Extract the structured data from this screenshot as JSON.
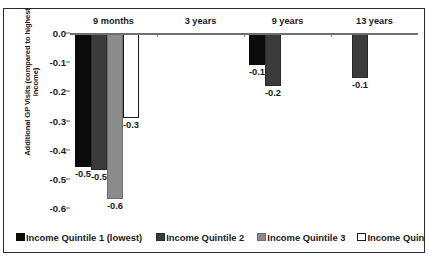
{
  "chart_data": {
    "type": "bar",
    "title": "",
    "subtitle": "",
    "xlabel": "",
    "ylabel": "Additional GP Visits (compared to highest income)",
    "ylabel_lines": [
      "Additional GP Visits (compared to highest",
      "income)"
    ],
    "categories": [
      "9 months",
      "3 years",
      "9 years",
      "13 years"
    ],
    "ylim": [
      -0.6,
      0.0
    ],
    "ytick_labels": [
      "0.0",
      "-0.1",
      "-0.2",
      "-0.3",
      "-0.4",
      "-0.5",
      "-0.6"
    ],
    "ytick_values": [
      0.0,
      -0.1,
      -0.2,
      -0.3,
      -0.4,
      -0.5,
      -0.6
    ],
    "grid": false,
    "legend_position": "bottom",
    "orientation": "vertical",
    "series": [
      {
        "name": "Income Quintile 1 (lowest)",
        "key": "q1",
        "color": "#0b0b0b",
        "values": [
          -0.46,
          null,
          -0.11,
          null
        ],
        "labels": [
          "-0.5",
          "",
          "-0.1",
          ""
        ]
      },
      {
        "name": "Income Quintile 2",
        "key": "q2",
        "color": "#3b3b3b",
        "values": [
          -0.47,
          null,
          -0.18,
          -0.155
        ],
        "labels": [
          "-0.5",
          "",
          "-0.2",
          "-0.1"
        ]
      },
      {
        "name": "Income Quintile 3",
        "key": "q3",
        "color": "#8b8b8b",
        "values": [
          -0.57,
          null,
          null,
          null
        ],
        "labels": [
          "-0.6",
          "",
          "",
          ""
        ]
      },
      {
        "name": "Income Quintile 4",
        "key": "q4",
        "color": "#ffffff",
        "values": [
          -0.29,
          null,
          null,
          null
        ],
        "labels": [
          "-0.3",
          "",
          "",
          ""
        ]
      }
    ],
    "data_point_labels": [
      {
        "category": "9 months",
        "series": "Income Quintile 1 (lowest)",
        "label": "-0.5"
      },
      {
        "category": "9 months",
        "series": "Income Quintile 2",
        "label": "-0.5"
      },
      {
        "category": "9 months",
        "series": "Income Quintile 3",
        "label": "-0.6"
      },
      {
        "category": "9 months",
        "series": "Income Quintile 4",
        "label": "-0.3"
      },
      {
        "category": "9 years",
        "series": "Income Quintile 1 (lowest)",
        "label": "-0.1"
      },
      {
        "category": "9 years",
        "series": "Income Quintile 2",
        "label": "-0.2"
      },
      {
        "category": "13 years",
        "series": "Income Quintile 2",
        "label": "-0.1"
      }
    ]
  },
  "legend": {
    "items": [
      {
        "label": "Income Quintile 1 (lowest)",
        "swatch": "q1"
      },
      {
        "label": "Income Quintile 2",
        "swatch": "q2"
      },
      {
        "label": "Income Quintile 3",
        "swatch": "q3"
      },
      {
        "label": "Income Quintile 4",
        "swatch": "q4"
      }
    ]
  }
}
